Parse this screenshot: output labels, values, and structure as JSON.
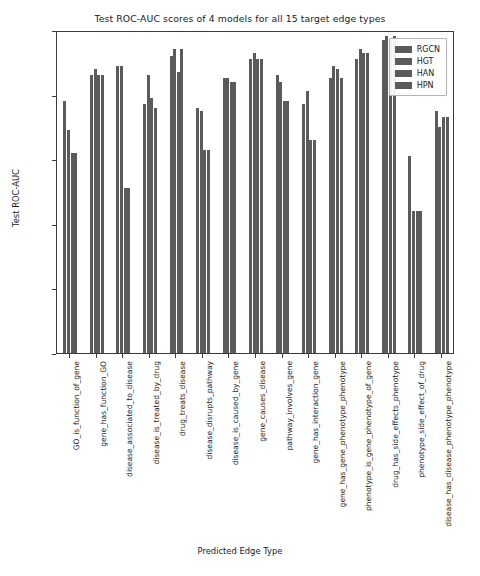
{
  "chart_data": {
    "type": "bar",
    "title": "Test ROC-AUC scores of 4 models for all 15 target edge types",
    "xlabel": "Predicted Edge Type",
    "ylabel": "Test ROC-AUC",
    "ylim": [
      0.0,
      1.0
    ],
    "yticks": [
      "0.0",
      "0.2",
      "0.4",
      "0.6",
      "0.8",
      "1.0"
    ],
    "ytick_values": [
      0.0,
      0.2,
      0.4,
      0.6,
      0.8,
      1.0
    ],
    "grid": false,
    "legend_position": "upper right",
    "bar_color": "#5b5b5b",
    "categories": [
      "GO_is_function_of_gene",
      "gene_has_function_GO",
      "disease_associated_to_disease",
      "disease_is_treated_by_drug",
      "drug_treats_disease",
      "disease_disrupts_pathway",
      "disease_is_caused_by_gene",
      "gene_causes_disease",
      "pathway_involves_gene",
      "gene_has_interaction_gene",
      "gene_has_gene_phenotype_phenotype",
      "phenotype_is_gene_phenotype_of_gene",
      "drug_has_side_effects_phenotype",
      "phenotype_side_effect_of_drug",
      "disease_has_disease_phenotype_phenotype"
    ],
    "series": [
      {
        "name": "RGCN",
        "values": [
          0.78,
          0.86,
          0.89,
          0.77,
          0.92,
          0.76,
          0.85,
          0.91,
          0.86,
          0.77,
          0.85,
          0.91,
          0.97,
          0.61,
          0.75
        ]
      },
      {
        "name": "HGT",
        "values": [
          0.69,
          0.88,
          0.89,
          0.86,
          0.94,
          0.75,
          0.85,
          0.93,
          0.84,
          0.81,
          0.89,
          0.94,
          0.98,
          0.44,
          0.7
        ]
      },
      {
        "name": "HAN",
        "values": [
          0.62,
          0.86,
          0.51,
          0.79,
          0.87,
          0.63,
          0.84,
          0.91,
          0.78,
          0.66,
          0.88,
          0.93,
          0.97,
          0.44,
          0.73
        ]
      },
      {
        "name": "HPN",
        "values": [
          0.62,
          0.86,
          0.51,
          0.76,
          0.94,
          0.63,
          0.84,
          0.91,
          0.78,
          0.66,
          0.85,
          0.93,
          0.98,
          0.44,
          0.73
        ]
      }
    ]
  },
  "legend": {
    "entries": [
      "RGCN",
      "HGT",
      "HAN",
      "HPN"
    ]
  }
}
